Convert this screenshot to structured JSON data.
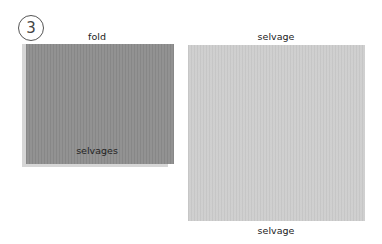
{
  "step": {
    "number": "3"
  },
  "folded_fabric": {
    "top_label": "fold",
    "bottom_label": "selvages",
    "color": "#8e8e8e"
  },
  "open_fabric": {
    "top_label": "selvage",
    "bottom_label": "selvage",
    "color": "#cdcdcd"
  }
}
